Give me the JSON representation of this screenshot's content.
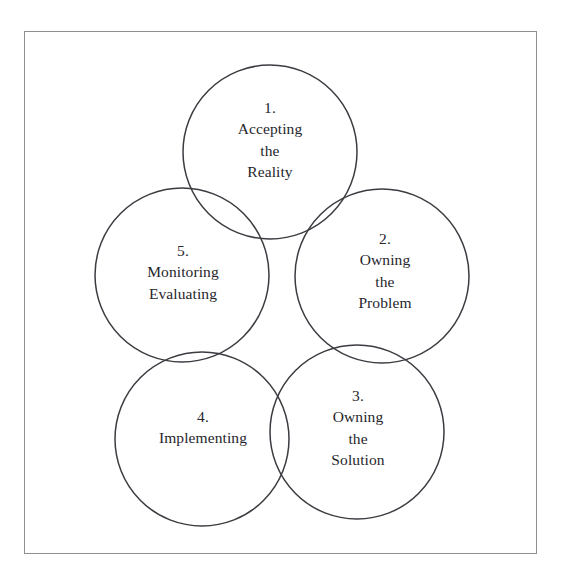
{
  "diagram": {
    "shape": "circle",
    "stroke_color": "#3b3b41",
    "text_color": "#26262c",
    "frame_color": "#8d8f91",
    "background": "#ffffff",
    "nodes": [
      {
        "id": "node-1",
        "number": "1.",
        "lines": [
          "1.",
          "Accepting",
          "the",
          "Reality"
        ],
        "text": "1. Accepting the Reality",
        "cx": 270,
        "cy": 152,
        "r": 87,
        "label_cx": 270,
        "label_cy": 140
      },
      {
        "id": "node-2",
        "number": "2.",
        "lines": [
          "2.",
          "Owning",
          "the",
          "Problem"
        ],
        "text": "2. Owning the Problem",
        "cx": 382,
        "cy": 276,
        "r": 87,
        "label_cx": 385,
        "label_cy": 271
      },
      {
        "id": "node-3",
        "number": "3.",
        "lines": [
          "3.",
          "Owning",
          "the",
          "Solution"
        ],
        "text": "3. Owning the Solution",
        "cx": 357,
        "cy": 432,
        "r": 87,
        "label_cx": 358,
        "label_cy": 428
      },
      {
        "id": "node-4",
        "number": "4.",
        "lines": [
          "4.",
          "Implementing"
        ],
        "text": "4. Implementing",
        "cx": 202,
        "cy": 439,
        "r": 87,
        "label_cx": 203,
        "label_cy": 427
      },
      {
        "id": "node-5",
        "number": "5.",
        "lines": [
          "5.",
          "Monitoring",
          "Evaluating"
        ],
        "text": "5. Monitoring Evaluating",
        "cx": 182,
        "cy": 275,
        "r": 87,
        "label_cx": 183,
        "label_cy": 272
      }
    ]
  }
}
